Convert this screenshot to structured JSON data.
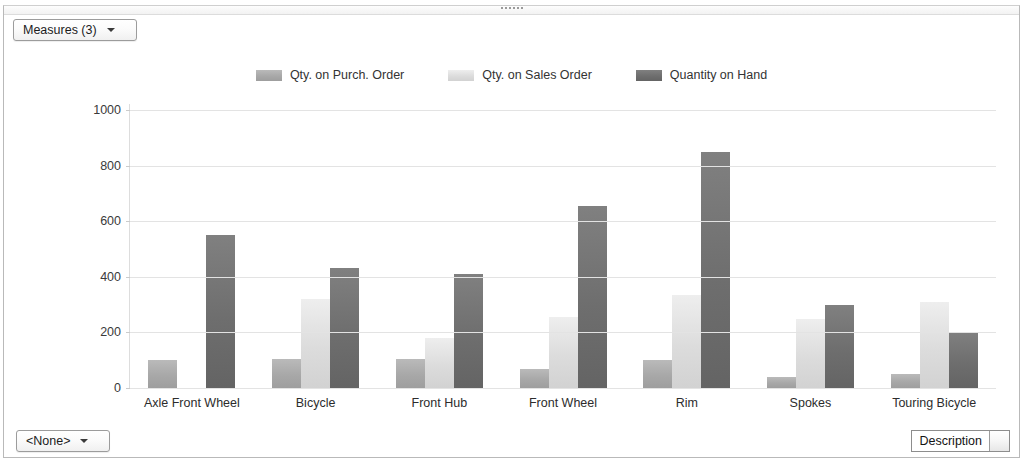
{
  "window": {
    "grip_name": "resize-grip"
  },
  "toolbar": {
    "measures_label": "Measures (3)"
  },
  "footer": {
    "none_label": "<None>",
    "description_label": "Description"
  },
  "chart_data": {
    "type": "bar",
    "title": "",
    "subtitle": "",
    "xlabel": "",
    "ylabel": "",
    "ylim": [
      0,
      1000
    ],
    "yticks": [
      1000,
      800,
      600,
      400,
      200,
      0
    ],
    "grid": true,
    "legend_position": "top-center",
    "categories": [
      "Axle Front Wheel",
      "Bicycle",
      "Front Hub",
      "Front Wheel",
      "Rim",
      "Spokes",
      "Touring Bicycle"
    ],
    "series": [
      {
        "name": "Qty. on Purch. Order",
        "color": "#a8a8a8",
        "values": [
          100,
          105,
          105,
          70,
          100,
          40,
          50
        ]
      },
      {
        "name": "Qty. on Sales Order",
        "color": "#dcdcdc",
        "values": [
          0,
          320,
          180,
          255,
          335,
          250,
          310
        ]
      },
      {
        "name": "Quantity on Hand",
        "color": "#6e6e6e",
        "values": [
          550,
          430,
          410,
          655,
          850,
          300,
          200
        ]
      }
    ]
  }
}
